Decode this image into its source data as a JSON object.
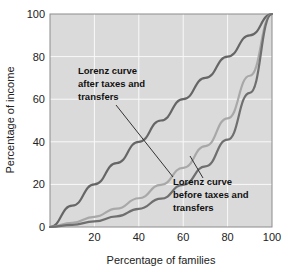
{
  "chart_data": {
    "type": "line",
    "title": "",
    "xlabel": "Percentage of families",
    "ylabel": "Percentage of income",
    "xlim": [
      0,
      100
    ],
    "ylim": [
      0,
      100
    ],
    "xticks": [
      20,
      40,
      60,
      80,
      100
    ],
    "xtick_labels": [
      "20",
      "40",
      "60",
      "80",
      "100"
    ],
    "yticks": [
      0,
      20,
      40,
      60,
      80,
      100
    ],
    "ytick_labels": [
      "0",
      "20",
      "40",
      "60",
      "80",
      "100"
    ],
    "grid": true,
    "legend_position": "none",
    "plot_background": "#dcdcdc",
    "grid_color": "#ffffff",
    "x": [
      0,
      10,
      20,
      30,
      40,
      50,
      60,
      70,
      80,
      90,
      100
    ],
    "series": [
      {
        "name": "Line of equality",
        "color": "#666666",
        "values": [
          0,
          10,
          20,
          30,
          40,
          50,
          60,
          70,
          80,
          90,
          100
        ]
      },
      {
        "name": "Lorenz curve after taxes and transfers",
        "color": "#a8a8a8",
        "values": [
          0,
          2.0,
          4.8,
          8.6,
          13.5,
          19.8,
          27.8,
          38.0,
          51.0,
          71.0,
          100
        ]
      },
      {
        "name": "Lorenz curve before taxes and transfers",
        "color": "#6f6f6f",
        "values": [
          0,
          1.0,
          2.6,
          5.0,
          8.5,
          13.3,
          19.8,
          28.5,
          41.0,
          63.0,
          100
        ]
      }
    ],
    "annotations": [
      {
        "id": "after",
        "lines": [
          "Lorenz curve",
          "after taxes and",
          "transfers"
        ],
        "text_x": 78,
        "text_y": 74,
        "leader_from_x": 116,
        "leader_from_y": 105,
        "leader_to_x": 173,
        "leader_to_y": 177
      },
      {
        "id": "before",
        "lines": [
          "Lorenz curve",
          "before taxes and",
          "transfers"
        ],
        "text_x": 173,
        "text_y": 185,
        "leader_from_x": 203,
        "leader_from_y": 178,
        "leader_to_x": 190,
        "leader_to_y": 156
      }
    ]
  },
  "axes": {
    "x_title": "Percentage of families",
    "y_title": "Percentage of income"
  }
}
